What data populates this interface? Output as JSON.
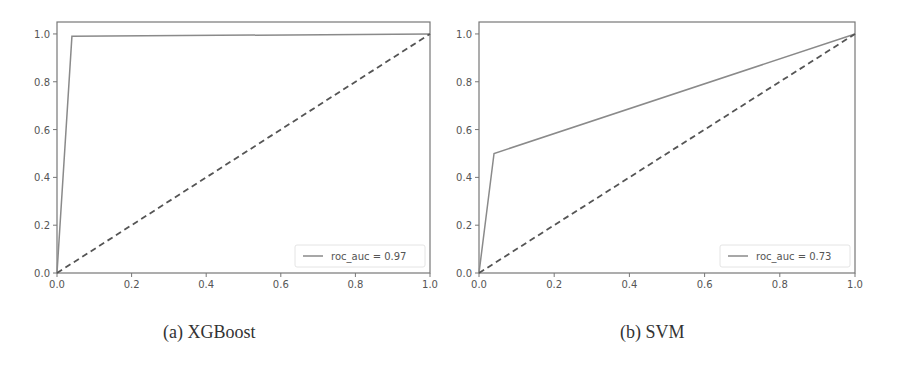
{
  "chart_data": [
    {
      "type": "line",
      "title": "",
      "caption": "(a)  XGBoost",
      "xlabel": "",
      "ylabel": "",
      "xlim": [
        0.0,
        1.0
      ],
      "ylim": [
        0.0,
        1.05
      ],
      "xticks": [
        "0.0",
        "0.2",
        "0.4",
        "0.6",
        "0.8",
        "1.0"
      ],
      "yticks": [
        "0.0",
        "0.2",
        "0.4",
        "0.6",
        "0.8",
        "1.0"
      ],
      "grid": false,
      "legend_position": "lower right",
      "series": [
        {
          "name": "roc_auc = 0.97",
          "style": "solid",
          "color": "#8a8a8a",
          "x": [
            0.0,
            0.04,
            1.0
          ],
          "y": [
            0.0,
            0.99,
            1.0
          ]
        },
        {
          "name": "chance",
          "style": "dashed",
          "color": "#555555",
          "x": [
            0.0,
            1.0
          ],
          "y": [
            0.0,
            1.0
          ]
        }
      ]
    },
    {
      "type": "line",
      "title": "",
      "caption": "(b) SVM",
      "xlabel": "",
      "ylabel": "",
      "xlim": [
        0.0,
        1.0
      ],
      "ylim": [
        0.0,
        1.05
      ],
      "xticks": [
        "0.0",
        "0.2",
        "0.4",
        "0.6",
        "0.8",
        "1.0"
      ],
      "yticks": [
        "0.0",
        "0.2",
        "0.4",
        "0.6",
        "0.8",
        "1.0"
      ],
      "grid": false,
      "legend_position": "lower right",
      "series": [
        {
          "name": "roc_auc = 0.73",
          "style": "solid",
          "color": "#8a8a8a",
          "x": [
            0.0,
            0.04,
            1.0
          ],
          "y": [
            0.0,
            0.5,
            1.0
          ]
        },
        {
          "name": "chance",
          "style": "dashed",
          "color": "#555555",
          "x": [
            0.0,
            1.0
          ],
          "y": [
            0.0,
            1.0
          ]
        }
      ]
    }
  ],
  "captions": {
    "a": "(a)  XGBoost",
    "b": "(b) SVM"
  },
  "legends": {
    "a": "roc_auc = 0.97",
    "b": "roc_auc = 0.73"
  }
}
